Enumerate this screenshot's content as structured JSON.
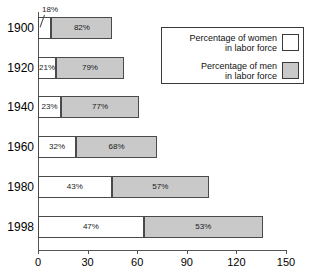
{
  "chart": {
    "title_partial": "",
    "xlabel": "",
    "ylabel": ""
  },
  "legend": {
    "items": [
      {
        "line1": "Percentage of women",
        "line2": "in labor force",
        "swatch": "white-swatch",
        "color": "#ffffff"
      },
      {
        "line1": "Percentage of men",
        "line2": "in labor force",
        "swatch": "gray-swatch",
        "color": "#c9c9c9"
      }
    ]
  },
  "axis": {
    "ticks": [
      "0",
      "30",
      "60",
      "90",
      "120",
      "150"
    ],
    "tick_values": [
      0,
      30,
      60,
      90,
      120,
      150
    ]
  },
  "rows": [
    {
      "year": "1900",
      "women_label": "18%",
      "men_label": "82%",
      "women": 8.1,
      "men": 36.9,
      "total": 45.0,
      "callout": true
    },
    {
      "year": "1920",
      "women_label": "21%",
      "men_label": "79%",
      "women": 10.9,
      "men": 41.1,
      "total": 52.0,
      "callout": false
    },
    {
      "year": "1940",
      "women_label": "23%",
      "men_label": "77%",
      "women": 14.0,
      "men": 47.0,
      "total": 61.0,
      "callout": false
    },
    {
      "year": "1960",
      "women_label": "32%",
      "men_label": "68%",
      "women": 23.0,
      "men": 49.0,
      "total": 72.0,
      "callout": false
    },
    {
      "year": "1980",
      "women_label": "43%",
      "men_label": "57%",
      "women": 44.5,
      "men": 59.0,
      "total": 103.5,
      "callout": false
    },
    {
      "year": "1998",
      "women_label": "47%",
      "men_label": "53%",
      "women": 64.0,
      "men": 72.0,
      "total": 136.0,
      "callout": false
    }
  ],
  "chart_data": {
    "type": "bar",
    "orientation": "horizontal",
    "stacked": true,
    "title": "",
    "xlabel": "",
    "ylabel": "",
    "categories": [
      "1900",
      "1920",
      "1940",
      "1960",
      "1980",
      "1998"
    ],
    "series": [
      {
        "name": "Percentage of women in labor force",
        "color": "#ffffff",
        "values": [
          8.1,
          10.9,
          14.0,
          23.0,
          44.5,
          64.0
        ],
        "data_labels": [
          "18%",
          "21%",
          "23%",
          "32%",
          "43%",
          "47%"
        ]
      },
      {
        "name": "Percentage of men in labor force",
        "color": "#c9c9c9",
        "values": [
          36.9,
          41.1,
          47.0,
          49.0,
          59.0,
          72.0
        ],
        "data_labels": [
          "82%",
          "79%",
          "77%",
          "68%",
          "57%",
          "53%"
        ]
      }
    ],
    "totals": [
      45.0,
      52.0,
      61.0,
      72.0,
      103.5,
      136.0
    ],
    "xlim": [
      0,
      150
    ],
    "xticks": [
      0,
      30,
      60,
      90,
      120,
      150
    ],
    "grid": false,
    "legend_position": "top-right"
  }
}
